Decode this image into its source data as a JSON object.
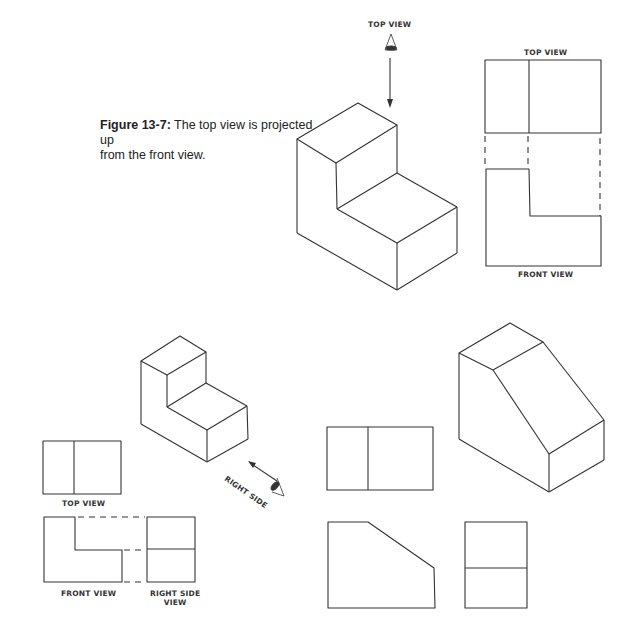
{
  "figure": {
    "number_label": "Figure 13-7:",
    "caption_line1": "The top view is projected up",
    "caption_line2": "from the front view."
  },
  "labels": {
    "top_view_eye": "TOP VIEW",
    "top_view_upper": "TOP VIEW",
    "front_view_upper": "FRONT VIEW",
    "top_view_lower": "TOP VIEW",
    "front_view_lower": "FRONT VIEW",
    "right_side_view_line1": "RIGHT SIDE",
    "right_side_view_line2": "VIEW",
    "right_side_eye": "RIGHT SIDE"
  },
  "icons": {
    "eye_top": "eye-icon",
    "eye_right": "eye-icon",
    "arrow_down": "arrow-down-icon",
    "arrow_diag": "arrow-up-left-icon"
  },
  "colors": {
    "line": "#333333",
    "background": "#ffffff"
  }
}
